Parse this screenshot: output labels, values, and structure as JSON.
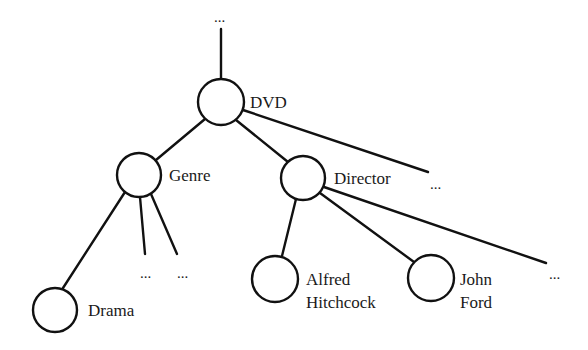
{
  "diagram": {
    "type": "tree",
    "nodes": [
      {
        "id": "dvd",
        "label": "DVD",
        "cx": 221,
        "cy": 102,
        "r": 23,
        "label_x": 252,
        "label_y": 108
      },
      {
        "id": "genre",
        "label": "Genre",
        "cx": 139,
        "cy": 175,
        "r": 22,
        "label_x": 169,
        "label_y": 181
      },
      {
        "id": "director",
        "label": "Director",
        "cx": 303,
        "cy": 178,
        "r": 22,
        "label_x": 333,
        "label_y": 184
      },
      {
        "id": "drama",
        "label": "Drama",
        "cx": 55,
        "cy": 310,
        "r": 22,
        "label_x": 87,
        "label_y": 316
      },
      {
        "id": "alfred-hitchcock",
        "label_line1": "Alfred",
        "label_line2": "Hitchcock",
        "cx": 275,
        "cy": 279,
        "r": 23,
        "label_x": 305,
        "label_y1": 285,
        "label_y2": 307
      },
      {
        "id": "john-ford",
        "label_line1": "John",
        "label_line2": "Ford",
        "cx": 431,
        "cy": 278,
        "r": 23,
        "label_x": 460,
        "label_y1": 285,
        "label_y2": 307
      }
    ],
    "labels": {
      "dvd": "DVD",
      "genre": "Genre",
      "director": "Director",
      "drama": "Drama",
      "alfred_line1": "Alfred",
      "alfred_line2": "Hitchcock",
      "john_line1": "John",
      "john_line2": "Ford"
    },
    "ellipses": {
      "top": "...",
      "dvd_right": "...",
      "genre_mid": "...",
      "genre_right": "...",
      "director_right": "..."
    },
    "edges": [
      {
        "from": "top-ellipsis",
        "to": "dvd"
      },
      {
        "from": "dvd",
        "to": "genre"
      },
      {
        "from": "dvd",
        "to": "director"
      },
      {
        "from": "dvd",
        "to": "dvd-right-ellipsis"
      },
      {
        "from": "genre",
        "to": "drama"
      },
      {
        "from": "genre",
        "to": "genre-mid-ellipsis"
      },
      {
        "from": "genre",
        "to": "genre-right-ellipsis"
      },
      {
        "from": "director",
        "to": "alfred-hitchcock"
      },
      {
        "from": "director",
        "to": "john-ford"
      },
      {
        "from": "director",
        "to": "director-right-ellipsis"
      }
    ]
  }
}
